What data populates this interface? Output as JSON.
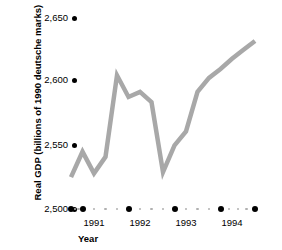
{
  "chart_data": {
    "type": "line",
    "title": "",
    "xlabel": "Year",
    "ylabel": "Real GDP (billions of 1990 deutsche marks)",
    "ylim": [
      2500,
      2650
    ],
    "y_ticks": [
      "2,500",
      "2,550",
      "2,600",
      "2,650"
    ],
    "y_tick_values": [
      2500,
      2550,
      2600,
      2650
    ],
    "xlim": [
      1990.75,
      1994.75
    ],
    "x_ticks": [
      "1991",
      "1992",
      "1993",
      "1994"
    ],
    "x_tick_values": [
      1991,
      1992,
      1993,
      1994
    ],
    "grid": false,
    "legend": "none",
    "line_color": "#a8a8a8",
    "axis_dot_color": "#000000",
    "minor_dot_color": "#b0b0b0",
    "x": [
      1990.75,
      1991.0,
      1991.25,
      1991.5,
      1991.75,
      1992.0,
      1992.25,
      1992.5,
      1992.75,
      1993.0,
      1993.25,
      1993.5,
      1993.75,
      1994.0,
      1994.25,
      1994.5,
      1994.75
    ],
    "values": [
      2525,
      2545,
      2528,
      2541,
      2605,
      2588,
      2592,
      2584,
      2529,
      2550,
      2561,
      2592,
      2603,
      2610,
      2618,
      2625,
      2632
    ],
    "series": [
      {
        "name": "Real GDP",
        "values": [
          2525,
          2545,
          2528,
          2541,
          2605,
          2588,
          2592,
          2584,
          2529,
          2550,
          2561,
          2592,
          2603,
          2610,
          2618,
          2625,
          2632
        ]
      }
    ]
  },
  "axes": {
    "y_title": "Real GDP (billions of 1990 deutsche marks)",
    "x_title": "Year"
  }
}
